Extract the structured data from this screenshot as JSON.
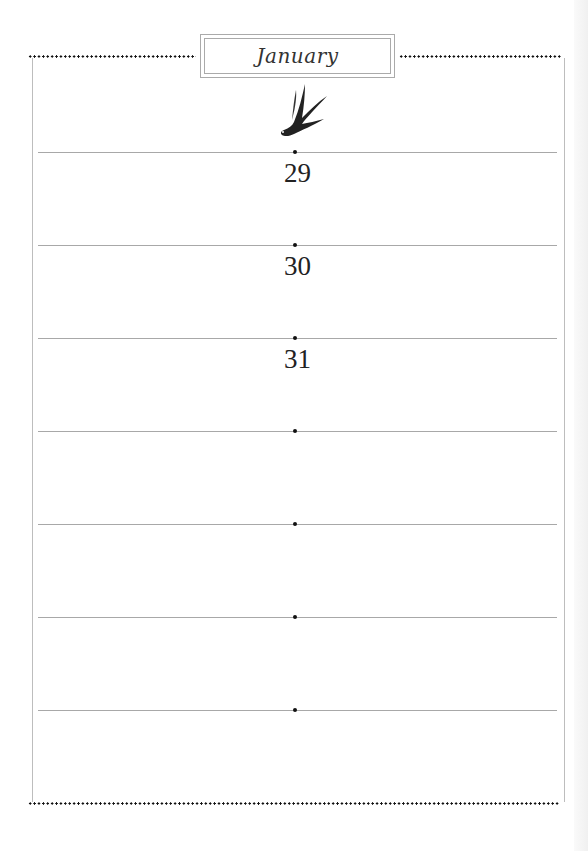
{
  "page": {
    "month_title": "January",
    "icon": "swallow-bird-icon",
    "days": [
      {
        "label": "29"
      },
      {
        "label": "30"
      },
      {
        "label": "31"
      },
      {
        "label": ""
      },
      {
        "label": ""
      },
      {
        "label": ""
      },
      {
        "label": ""
      }
    ]
  },
  "colors": {
    "rule": "#a8a8a8",
    "dots": "#111111",
    "frame": "#bdbdbd"
  }
}
